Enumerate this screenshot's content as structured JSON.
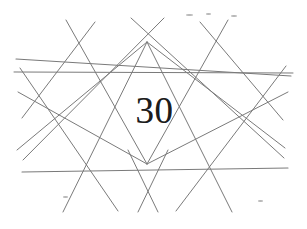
{
  "figure": {
    "label": "30",
    "caption_number": "30",
    "background_color": "#ffffff",
    "line_color": "#7a7a7a",
    "faint_line_color": "#b9b9b9",
    "numeral_color": "#1c1c1c",
    "line_width": 1,
    "width": 307,
    "height": 229
  },
  "chart_data": {
    "type": "line",
    "title": "30",
    "xlabel": "",
    "ylabel": "",
    "xlim": [
      0,
      307
    ],
    "ylim": [
      0,
      229
    ],
    "grid": false,
    "legend": "none",
    "nodes": [
      {
        "name": "top-node",
        "x": 147,
        "y": 42
      },
      {
        "name": "bottom-node",
        "x": 147,
        "y": 164
      },
      {
        "name": "upper-mid-node",
        "x": 147,
        "y": 70
      },
      {
        "name": "lower-mid-node",
        "x": 147,
        "y": 186
      }
    ],
    "series": [
      {
        "name": "horizontal-upper",
        "x": [
          16,
          291
        ],
        "y": [
          59,
          76
        ],
        "weight": 1.1
      },
      {
        "name": "horizontal-lower",
        "x": [
          22,
          288
        ],
        "y": [
          172,
          168
        ],
        "weight": 1.1
      },
      {
        "name": "horizontal-mid-left",
        "x": [
          14,
          293
        ],
        "y": [
          72,
          73
        ],
        "weight": 1.0
      },
      {
        "name": "fan-top-to-bottomleft",
        "x": [
          147,
          63
        ],
        "y": [
          42,
          212
        ],
        "weight": 1.0
      },
      {
        "name": "fan-top-to-bottomright",
        "x": [
          147,
          232
        ],
        "y": [
          42,
          212
        ],
        "weight": 1.0
      },
      {
        "name": "fan-top-to-left",
        "x": [
          147,
          17
        ],
        "y": [
          42,
          150
        ],
        "weight": 1.0
      },
      {
        "name": "fan-top-to-right",
        "x": [
          147,
          285
        ],
        "y": [
          42,
          148
        ],
        "weight": 1.0
      },
      {
        "name": "fan-bottom-to-topleft",
        "x": [
          147,
          66
        ],
        "y": [
          164,
          20
        ],
        "weight": 1.0
      },
      {
        "name": "fan-bottom-to-topright",
        "x": [
          147,
          228
        ],
        "y": [
          164,
          20
        ],
        "weight": 1.0
      },
      {
        "name": "fan-bottom-to-left",
        "x": [
          147,
          18
        ],
        "y": [
          164,
          92
        ],
        "weight": 1.0
      },
      {
        "name": "fan-bottom-to-right",
        "x": [
          147,
          288
        ],
        "y": [
          164,
          92
        ],
        "weight": 1.0
      },
      {
        "name": "diagonal-left-down",
        "x": [
          20,
          118
        ],
        "y": [
          68,
          211
        ],
        "weight": 1.0
      },
      {
        "name": "diagonal-right-down",
        "x": [
          286,
          176
        ],
        "y": [
          66,
          211
        ],
        "weight": 1.0
      },
      {
        "name": "diagonal-left-up",
        "x": [
          23,
          164
        ],
        "y": [
          160,
          18
        ],
        "weight": 1.0
      },
      {
        "name": "diagonal-right-up",
        "x": [
          284,
          131
        ],
        "y": [
          158,
          18
        ],
        "weight": 1.0
      },
      {
        "name": "short-upper-left",
        "x": [
          95,
          22
        ],
        "y": [
          22,
          118
        ],
        "weight": 1.0
      },
      {
        "name": "short-upper-right",
        "x": [
          200,
          283
        ],
        "y": [
          22,
          120
        ],
        "weight": 1.0
      },
      {
        "name": "v-left-bottom",
        "x": [
          128,
          158
        ],
        "y": [
          150,
          212
        ],
        "weight": 1.0
      },
      {
        "name": "v-right-bottom",
        "x": [
          168,
          138
        ],
        "y": [
          150,
          212
        ],
        "weight": 1.0
      }
    ],
    "specks": [
      {
        "x": 186,
        "y": 14,
        "w": 7,
        "h": 2
      },
      {
        "x": 206,
        "y": 13,
        "w": 5,
        "h": 2
      },
      {
        "x": 231,
        "y": 15,
        "w": 6,
        "h": 2
      },
      {
        "x": 63,
        "y": 196,
        "w": 5,
        "h": 2
      },
      {
        "x": 258,
        "y": 200,
        "w": 5,
        "h": 2
      }
    ]
  }
}
